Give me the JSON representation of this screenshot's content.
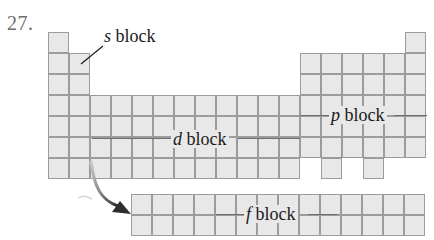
{
  "problem_number": "27.",
  "grid": {
    "origin_x": 48,
    "origin_y": 32,
    "cell": 21,
    "cell_fill": "#e8e8e8",
    "line_color": "#9c9c9c",
    "main_rows": [
      [
        1,
        18
      ],
      [
        1,
        2,
        13,
        14,
        15,
        16,
        17,
        18
      ],
      [
        1,
        2,
        13,
        14,
        15,
        16,
        17,
        18
      ],
      [
        1,
        2,
        3,
        4,
        5,
        6,
        7,
        8,
        9,
        10,
        11,
        12,
        13,
        14,
        15,
        16,
        17,
        18
      ],
      [
        1,
        2,
        3,
        4,
        5,
        6,
        7,
        8,
        9,
        10,
        11,
        12,
        13,
        14,
        15,
        16,
        17,
        18
      ],
      [
        1,
        2,
        3,
        4,
        5,
        6,
        7,
        8,
        9,
        10,
        11,
        12,
        13,
        14,
        15,
        16,
        17,
        18
      ],
      [
        1,
        2,
        3,
        4,
        5,
        6,
        7,
        8,
        9,
        10,
        11,
        12,
        14,
        16
      ]
    ],
    "f_block": {
      "start_col": 5,
      "end_col": 18,
      "rows": 2,
      "top_y": 194
    }
  },
  "labels": {
    "s_block": {
      "letter": "s",
      "word": " block"
    },
    "d_block": {
      "letter": "d",
      "word": " block"
    },
    "p_block": {
      "letter": "p",
      "word": " block"
    },
    "f_block": {
      "letter": "f",
      "word": " block"
    }
  },
  "arrow": {
    "from": "d-block row 7 (lanthanide/actinide position)",
    "to": "f block",
    "color": "#2e2e2e"
  }
}
